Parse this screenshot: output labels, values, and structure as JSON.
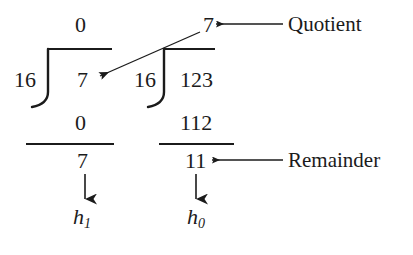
{
  "figure": {
    "background_color": "#ffffff",
    "ink_color": "#1b1b1b"
  },
  "divisions": {
    "left": {
      "divisor": "16",
      "dividend": "7",
      "quotient": "0",
      "product": "0",
      "remainder": "7",
      "result_variable": "h",
      "result_subscript": "1"
    },
    "right": {
      "divisor": "16",
      "dividend": "123",
      "quotient": "7",
      "product": "112",
      "remainder": "11",
      "result_variable": "h",
      "result_subscript": "0"
    }
  },
  "annotations": {
    "quotient_label": "Quotient",
    "remainder_label": "Remainder"
  },
  "icons": {
    "quotient_arrow": "arrow-left-icon",
    "remainder_arrow": "arrow-left-icon",
    "carry_arrow": "arrow-diagonal-down-left-icon",
    "left_result_arrow": "arrow-down-icon",
    "right_result_arrow": "arrow-down-icon",
    "left_division_bracket": "division-bracket-icon",
    "right_division_bracket": "division-bracket-icon"
  }
}
